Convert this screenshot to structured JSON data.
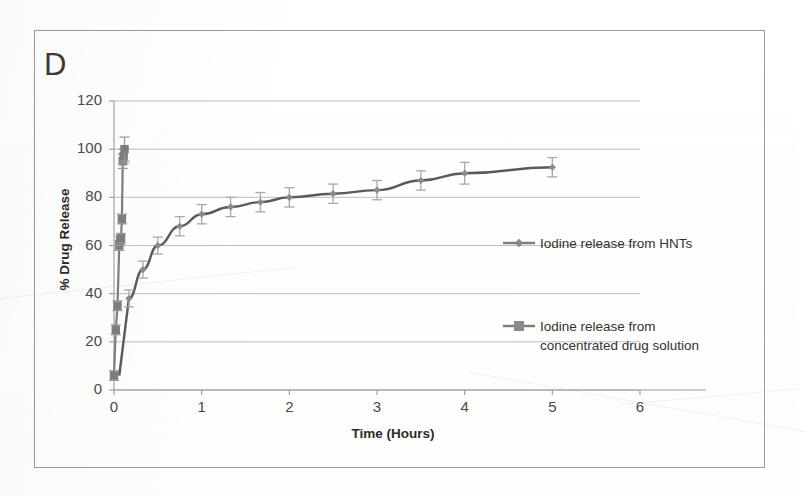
{
  "figure": {
    "panel_letter": "D"
  },
  "chart_data": {
    "type": "line",
    "title": "",
    "xlabel": "Time (Hours)",
    "ylabel": "% Drug Release",
    "xlim": [
      0,
      6
    ],
    "ylim": [
      0,
      120
    ],
    "xticks": [
      0,
      1,
      2,
      3,
      4,
      5,
      6
    ],
    "yticks": [
      0,
      20,
      40,
      60,
      80,
      100,
      120
    ],
    "xtick_labels": [
      "0",
      "1",
      "2",
      "3",
      "4",
      "5",
      "6"
    ],
    "ytick_labels": [
      "0",
      "20",
      "40",
      "60",
      "80",
      "100",
      "120"
    ],
    "grid": "horizontal",
    "legend_position": "inside-right",
    "series": [
      {
        "name": "Iodine release from HNTs",
        "marker": "diamond",
        "color": "#8a8a8a",
        "line_color": "#5a5a5a",
        "x": [
          0.17,
          0.33,
          0.5,
          0.75,
          1.0,
          1.33,
          1.67,
          2.0,
          2.5,
          3.0,
          3.5,
          4.0,
          5.0
        ],
        "y": [
          38,
          50,
          60,
          68,
          73,
          76,
          78,
          80,
          81.5,
          83,
          87,
          90,
          92.5
        ],
        "yerr": [
          3.5,
          3.5,
          3.5,
          4,
          4,
          4,
          4,
          4,
          4,
          4,
          4,
          4.5,
          4
        ]
      },
      {
        "name": "Iodine release from concentrated drug solution",
        "marker": "square",
        "color": "#7d7d7d",
        "line_color": "#7d7d7d",
        "x": [
          0.0,
          0.02,
          0.04,
          0.06,
          0.07,
          0.08,
          0.09,
          0.1,
          0.11,
          0.12
        ],
        "y": [
          6,
          25,
          35,
          60,
          62,
          63,
          71,
          95,
          97,
          100
        ],
        "yerr": [
          2,
          2,
          2,
          2,
          2,
          2,
          2,
          3,
          3,
          5
        ]
      }
    ]
  },
  "legend": {
    "entries": [
      {
        "label": "Iodine release from HNTs",
        "marker": "diamond-line-marker",
        "label_line2": ""
      },
      {
        "label": "Iodine release from",
        "label_line2": "concentrated drug solution",
        "marker": "square-line-marker"
      }
    ]
  }
}
